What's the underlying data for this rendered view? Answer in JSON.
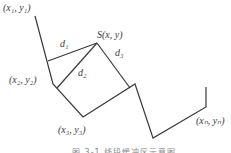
{
  "diagram": {
    "type": "geometry",
    "labels": {
      "p1": "(x₁, y₁)",
      "p2": "(x₂, y₂)",
      "p3": "(x₃, y₃)",
      "pn": "(xₙ, yₙ)",
      "s": "S(x, y)",
      "d1": "d₁",
      "d2": "d₂",
      "d3": "d₃"
    },
    "caption": "图 3-1  线段缓冲区示意图",
    "colors": {
      "line": "#3a3a3a",
      "text": "#3a3a3a",
      "caption": "#888888"
    }
  }
}
